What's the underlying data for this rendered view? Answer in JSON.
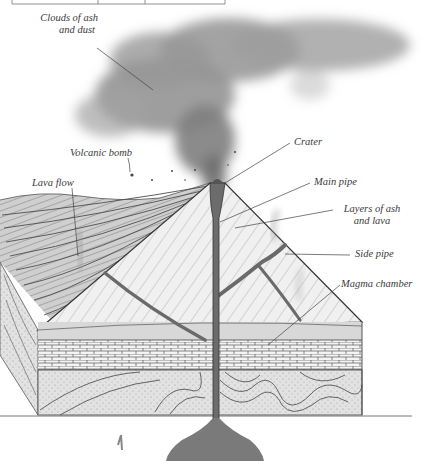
{
  "diagram": {
    "labels": {
      "clouds": {
        "line1": "Clouds of ash",
        "line2": "and dust"
      },
      "bomb": "Volcanic bomb",
      "lava_flow": "Lava flow",
      "crater": "Crater",
      "main_pipe": "Main pipe",
      "layers": {
        "line1": "Layers of ash",
        "line2": "and lava"
      },
      "side_pipe": "Side pipe",
      "magma_chamber": "Magma chamber"
    },
    "colors": {
      "ink": "#3a3a3a",
      "ash_cloud": "#8a8a8a",
      "magma": "#7a7a7a",
      "cone_fill": "#eeeeee",
      "rock_fill": "#d6d6d6",
      "brick_fill": "#f4f4f4"
    }
  },
  "table_fragment": {
    "visible": "bottom border with column dividers only"
  }
}
